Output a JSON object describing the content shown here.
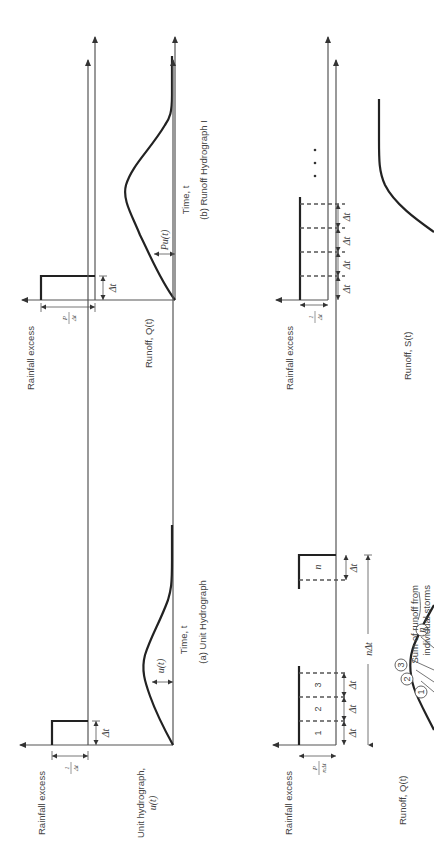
{
  "figure": {
    "orientation": "rotated-90-ccw",
    "panels": [
      {
        "id": "a",
        "caption": "(a) Unit Hydrograph",
        "rainfall_label": "Rainfall excess",
        "rainfall_height_label_num": "1",
        "rainfall_height_label_den": "Δt",
        "duration_label": "Δt",
        "runoff_label_line1": "Unit hydrograph,",
        "runoff_label_line2": "u(t)",
        "ordinate_label": "u(t)",
        "time_label": "Time, t"
      },
      {
        "id": "b",
        "caption": "(b) Runoff Hydrograph I",
        "rainfall_label": "Rainfall excess",
        "rainfall_height_label_num": "P",
        "rainfall_height_label_den": "Δt",
        "duration_label": "Δt",
        "runoff_label": "Runoff, Q(t)",
        "ordinate_label": "Pu(t)",
        "time_label": "Time, t"
      },
      {
        "id": "c",
        "rainfall_label": "Rainfall excess",
        "rainfall_height_label_num": "P",
        "rainfall_height_label_den": "nΔt",
        "block_labels": [
          "1",
          "2",
          "3",
          "n"
        ],
        "interval_labels": [
          "Δt",
          "Δt",
          "Δt",
          "Δt"
        ],
        "total_duration_label": "nΔt",
        "runoff_label": "Runoff, Q(t)",
        "storm_markers": [
          "1",
          "2",
          "3",
          "n"
        ],
        "annotation_line1": "Sum of runoff from",
        "annotation_line2": "individual storms"
      },
      {
        "id": "d",
        "rainfall_label": "Rainfall excess",
        "rainfall_height_label_num": "1",
        "rainfall_height_label_den": "Δt",
        "interval_labels": [
          "Δt",
          "Δt",
          "Δt",
          "Δt"
        ],
        "continuation": "• • •",
        "runoff_label": "Runoff, S(t)"
      }
    ]
  }
}
